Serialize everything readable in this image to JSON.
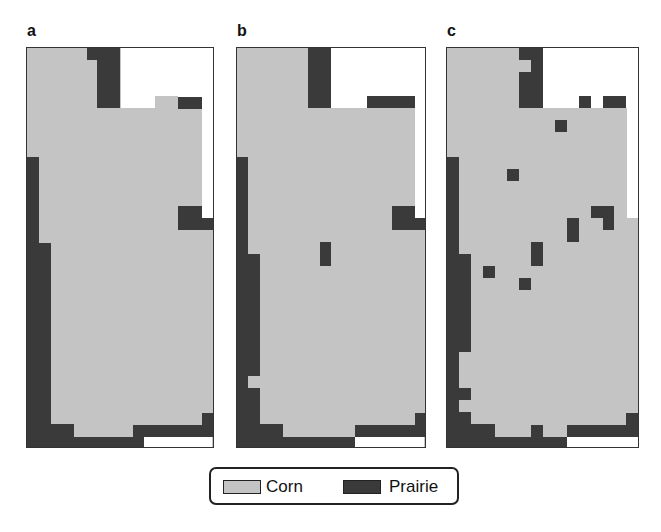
{
  "chart_data": {
    "type": "heatmap",
    "title": "",
    "panels": [
      {
        "label": "a"
      },
      {
        "label": "b"
      },
      {
        "label": "c"
      }
    ],
    "legend": [
      {
        "label": "Corn",
        "color": "#c4c4c4"
      },
      {
        "label": "Prairie",
        "color": "#3a3a3a"
      }
    ],
    "legend_position": "bottom-center",
    "colors": {
      "corn": "#c4c4c4",
      "prairie": "#3a3a3a",
      "outside": "#ffffff",
      "border": "#333333"
    },
    "rects": {
      "a": [
        {
          "t": "w",
          "x": 94,
          "y": 0,
          "w": 92,
          "h": 60
        },
        {
          "t": "w",
          "x": 175,
          "y": 0,
          "w": 11,
          "h": 170
        },
        {
          "t": "c",
          "x": 128,
          "y": 48,
          "w": 23,
          "h": 12
        },
        {
          "t": "p",
          "x": 60,
          "y": 0,
          "w": 33,
          "h": 12
        },
        {
          "t": "p",
          "x": 70,
          "y": 0,
          "w": 23,
          "h": 60
        },
        {
          "t": "p",
          "x": 151,
          "y": 49,
          "w": 24,
          "h": 12
        },
        {
          "t": "p",
          "x": 151,
          "y": 158,
          "w": 24,
          "h": 24
        },
        {
          "t": "p",
          "x": 175,
          "y": 170,
          "w": 11,
          "h": 12
        },
        {
          "t": "p",
          "x": 0,
          "y": 109,
          "w": 12,
          "h": 87
        },
        {
          "t": "p",
          "x": 0,
          "y": 195,
          "w": 24,
          "h": 230
        },
        {
          "t": "p",
          "x": 0,
          "y": 376,
          "w": 47,
          "h": 13
        },
        {
          "t": "p",
          "x": 0,
          "y": 389,
          "w": 117,
          "h": 12
        },
        {
          "t": "p",
          "x": 106,
          "y": 377,
          "w": 80,
          "h": 12
        },
        {
          "t": "p",
          "x": 175,
          "y": 365,
          "w": 11,
          "h": 12
        },
        {
          "t": "w",
          "x": 117,
          "y": 389,
          "w": 68,
          "h": 10
        }
      ],
      "b": [
        {
          "t": "w",
          "x": 94,
          "y": 0,
          "w": 94,
          "h": 60
        },
        {
          "t": "w",
          "x": 178,
          "y": 0,
          "w": 10,
          "h": 170
        },
        {
          "t": "p",
          "x": 71,
          "y": 0,
          "w": 23,
          "h": 60
        },
        {
          "t": "p",
          "x": 130,
          "y": 48,
          "w": 48,
          "h": 12
        },
        {
          "t": "p",
          "x": 83,
          "y": 194,
          "w": 11,
          "h": 24
        },
        {
          "t": "p",
          "x": 155,
          "y": 158,
          "w": 23,
          "h": 24
        },
        {
          "t": "p",
          "x": 178,
          "y": 170,
          "w": 10,
          "h": 12
        },
        {
          "t": "p",
          "x": 0,
          "y": 109,
          "w": 11,
          "h": 97
        },
        {
          "t": "p",
          "x": 0,
          "y": 206,
          "w": 23,
          "h": 122
        },
        {
          "t": "p",
          "x": 0,
          "y": 328,
          "w": 11,
          "h": 12
        },
        {
          "t": "p",
          "x": 0,
          "y": 340,
          "w": 23,
          "h": 36
        },
        {
          "t": "p",
          "x": 0,
          "y": 376,
          "w": 46,
          "h": 13
        },
        {
          "t": "p",
          "x": 0,
          "y": 389,
          "w": 118,
          "h": 12
        },
        {
          "t": "p",
          "x": 118,
          "y": 377,
          "w": 70,
          "h": 12
        },
        {
          "t": "p",
          "x": 178,
          "y": 365,
          "w": 10,
          "h": 12
        },
        {
          "t": "w",
          "x": 118,
          "y": 389,
          "w": 69,
          "h": 10
        }
      ],
      "c": [
        {
          "t": "w",
          "x": 96,
          "y": 0,
          "w": 95,
          "h": 60
        },
        {
          "t": "w",
          "x": 180,
          "y": 0,
          "w": 11,
          "h": 170
        },
        {
          "t": "p",
          "x": 72,
          "y": 0,
          "w": 24,
          "h": 60
        },
        {
          "t": "c",
          "x": 72,
          "y": 12,
          "w": 12,
          "h": 12
        },
        {
          "t": "p",
          "x": 132,
          "y": 48,
          "w": 12,
          "h": 12
        },
        {
          "t": "p",
          "x": 156,
          "y": 48,
          "w": 23,
          "h": 12
        },
        {
          "t": "p",
          "x": 108,
          "y": 72,
          "w": 12,
          "h": 12
        },
        {
          "t": "p",
          "x": 60,
          "y": 121,
          "w": 12,
          "h": 12
        },
        {
          "t": "p",
          "x": 144,
          "y": 158,
          "w": 23,
          "h": 12
        },
        {
          "t": "p",
          "x": 156,
          "y": 170,
          "w": 11,
          "h": 12
        },
        {
          "t": "p",
          "x": 120,
          "y": 170,
          "w": 12,
          "h": 24
        },
        {
          "t": "p",
          "x": 84,
          "y": 194,
          "w": 12,
          "h": 24
        },
        {
          "t": "p",
          "x": 36,
          "y": 218,
          "w": 12,
          "h": 12
        },
        {
          "t": "p",
          "x": 72,
          "y": 230,
          "w": 12,
          "h": 12
        },
        {
          "t": "p",
          "x": 0,
          "y": 109,
          "w": 12,
          "h": 97
        },
        {
          "t": "p",
          "x": 0,
          "y": 206,
          "w": 24,
          "h": 98
        },
        {
          "t": "p",
          "x": 0,
          "y": 304,
          "w": 12,
          "h": 36
        },
        {
          "t": "p",
          "x": 0,
          "y": 340,
          "w": 24,
          "h": 12
        },
        {
          "t": "p",
          "x": 0,
          "y": 352,
          "w": 12,
          "h": 12
        },
        {
          "t": "p",
          "x": 0,
          "y": 364,
          "w": 24,
          "h": 12
        },
        {
          "t": "p",
          "x": 0,
          "y": 376,
          "w": 48,
          "h": 13
        },
        {
          "t": "p",
          "x": 0,
          "y": 389,
          "w": 120,
          "h": 12
        },
        {
          "t": "p",
          "x": 84,
          "y": 377,
          "w": 12,
          "h": 12
        },
        {
          "t": "p",
          "x": 120,
          "y": 377,
          "w": 71,
          "h": 12
        },
        {
          "t": "p",
          "x": 179,
          "y": 365,
          "w": 12,
          "h": 24
        },
        {
          "t": "w",
          "x": 120,
          "y": 389,
          "w": 71,
          "h": 10
        }
      ]
    }
  },
  "labels": {
    "a": "a",
    "b": "b",
    "c": "c"
  },
  "legend": {
    "corn": "Corn",
    "prairie": "Prairie"
  }
}
